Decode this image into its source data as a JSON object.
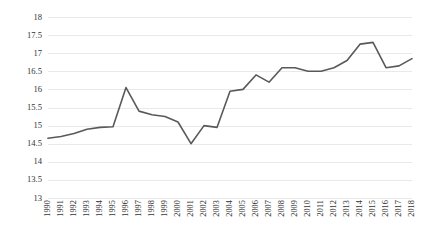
{
  "chart_data": {
    "type": "line",
    "title": "",
    "subtitle": "",
    "xlabel": "",
    "ylabel": "",
    "categories": [
      "1990",
      "1991",
      "1992",
      "1993",
      "1994",
      "1995",
      "1996",
      "1997",
      "1998",
      "1999",
      "2000",
      "2001",
      "2002",
      "2003",
      "2004",
      "2005",
      "2006",
      "2007",
      "2008",
      "2009",
      "2010",
      "2011",
      "2012",
      "2013",
      "2014",
      "2015",
      "2016",
      "2017",
      "2018"
    ],
    "values": [
      14.65,
      14.7,
      14.78,
      14.9,
      14.95,
      14.97,
      16.05,
      15.4,
      15.3,
      15.25,
      15.1,
      14.5,
      15.0,
      14.95,
      15.95,
      16.0,
      16.4,
      16.2,
      16.6,
      16.6,
      16.5,
      16.5,
      16.6,
      16.8,
      17.25,
      17.3,
      16.6,
      16.65,
      16.85
    ],
    "series": [
      {
        "name": "",
        "values": [
          14.65,
          14.7,
          14.78,
          14.9,
          14.95,
          14.97,
          16.05,
          15.4,
          15.3,
          15.25,
          15.1,
          14.5,
          15.0,
          14.95,
          15.95,
          16.0,
          16.4,
          16.2,
          16.6,
          16.6,
          16.5,
          16.5,
          16.6,
          16.8,
          17.25,
          17.3,
          16.6,
          16.65,
          16.85
        ],
        "color": "#595959"
      }
    ],
    "ylim": [
      13,
      18
    ],
    "yticks": [
      13,
      13.5,
      14,
      14.5,
      15,
      15.5,
      16,
      16.5,
      17,
      17.5,
      18
    ],
    "ytick_labels": [
      "13",
      "13.5",
      "14",
      "14.5",
      "15",
      "15.5",
      "16",
      "16.5",
      "17",
      "17.5",
      "18"
    ],
    "grid": true,
    "grid_axis": "y",
    "grid_color": "#e9e9e9",
    "legend": false,
    "legend_position": "none",
    "line_color": "#595959",
    "line_width": 1.6,
    "markers": false,
    "background": "#ffffff"
  }
}
